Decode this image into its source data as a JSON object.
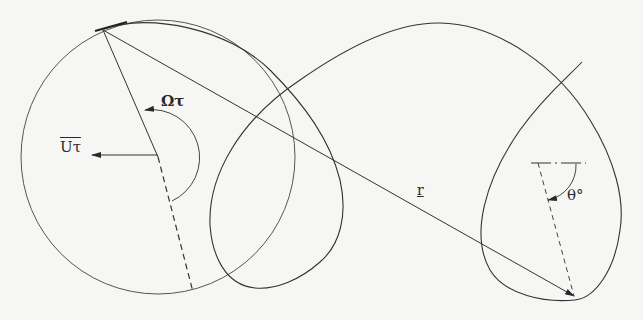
{
  "diagram": {
    "type": "geometric-construction",
    "colors": {
      "background": "#f6f6f4",
      "ink": "#333333"
    },
    "labels": {
      "translation": "Uτ",
      "translation_bar": "‾",
      "rotation": "Ωτ",
      "position_vector": "r",
      "angle": "θ°"
    },
    "elements": [
      {
        "id": "generating-circle",
        "kind": "circle",
        "center": [
          158,
          157
        ],
        "radius": 137
      },
      {
        "id": "trochoid-curve",
        "kind": "curve",
        "style": "solid"
      },
      {
        "id": "radius-line",
        "kind": "line",
        "from": [
          103,
          30
        ],
        "to": [
          158,
          157
        ],
        "style": "solid"
      },
      {
        "id": "radius-extension",
        "kind": "line",
        "from": [
          158,
          157
        ],
        "to": [
          193,
          292
        ],
        "style": "dashed"
      },
      {
        "id": "translation-arrow",
        "kind": "arrow",
        "from": [
          158,
          157
        ],
        "to": [
          92,
          157
        ]
      },
      {
        "id": "rotation-arc",
        "kind": "arc-arrow",
        "label": "Ωτ"
      },
      {
        "id": "position-vector",
        "kind": "arrow",
        "from": [
          103,
          30
        ],
        "to": [
          574,
          297
        ],
        "label": "r"
      },
      {
        "id": "reference-line",
        "kind": "line",
        "style": "dash-dot"
      },
      {
        "id": "angle-line",
        "kind": "line",
        "style": "dashed"
      },
      {
        "id": "angle-arc",
        "kind": "arc-arrow",
        "label": "θ°"
      }
    ]
  }
}
